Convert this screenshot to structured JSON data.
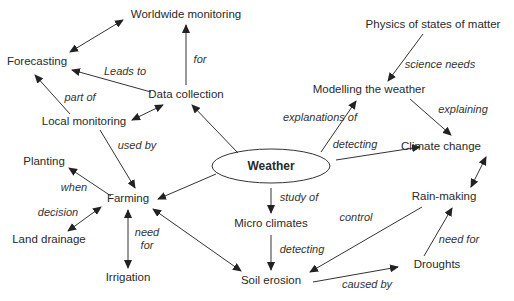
{
  "diagram": {
    "center": {
      "id": "weather",
      "label": "Weather",
      "x": 271,
      "y": 166,
      "rx": 59,
      "ry": 17
    },
    "nodes": [
      {
        "id": "worldwide",
        "label": "Worldwide monitoring",
        "x": 186,
        "y": 15
      },
      {
        "id": "forecasting",
        "label": "Forecasting",
        "x": 37,
        "y": 62
      },
      {
        "id": "data",
        "label": "Data collection",
        "x": 186,
        "y": 95
      },
      {
        "id": "local",
        "label": "Local monitoring",
        "x": 84,
        "y": 122
      },
      {
        "id": "physics",
        "label": "Physics of states of matter",
        "x": 433,
        "y": 25
      },
      {
        "id": "modelling",
        "label": "Modelling the weather",
        "x": 369,
        "y": 90
      },
      {
        "id": "climate",
        "label": "Climate change",
        "x": 441,
        "y": 147
      },
      {
        "id": "planting",
        "label": "Planting",
        "x": 44,
        "y": 162
      },
      {
        "id": "farming",
        "label": "Farming",
        "x": 128,
        "y": 199
      },
      {
        "id": "land",
        "label": "Land drainage",
        "x": 49,
        "y": 240
      },
      {
        "id": "irrigation",
        "label": "Irrigation",
        "x": 128,
        "y": 278
      },
      {
        "id": "micro",
        "label": "Micro climates",
        "x": 271,
        "y": 224
      },
      {
        "id": "soil",
        "label": "Soil erosion",
        "x": 271,
        "y": 281
      },
      {
        "id": "rain",
        "label": "Rain-making",
        "x": 444,
        "y": 197
      },
      {
        "id": "droughts",
        "label": "Droughts",
        "x": 437,
        "y": 265
      }
    ],
    "edges": [
      {
        "x1": 70,
        "y1": 52,
        "x2": 123,
        "y2": 20,
        "start_arrow": true,
        "end_arrow": true
      },
      {
        "x1": 186,
        "y1": 85,
        "x2": 186,
        "y2": 25,
        "start_arrow": false,
        "end_arrow": true
      },
      {
        "x1": 151,
        "y1": 92,
        "x2": 72,
        "y2": 70,
        "start_arrow": false,
        "end_arrow": true
      },
      {
        "x1": 70,
        "y1": 114,
        "x2": 35,
        "y2": 75,
        "start_arrow": false,
        "end_arrow": true
      },
      {
        "x1": 132,
        "y1": 120,
        "x2": 163,
        "y2": 105,
        "start_arrow": true,
        "end_arrow": true
      },
      {
        "x1": 238,
        "y1": 153,
        "x2": 192,
        "y2": 105,
        "start_arrow": false,
        "end_arrow": true
      },
      {
        "x1": 100,
        "y1": 130,
        "x2": 135,
        "y2": 188,
        "start_arrow": false,
        "end_arrow": true
      },
      {
        "x1": 216,
        "y1": 174,
        "x2": 158,
        "y2": 199,
        "start_arrow": false,
        "end_arrow": true
      },
      {
        "x1": 111,
        "y1": 196,
        "x2": 69,
        "y2": 168,
        "start_arrow": false,
        "end_arrow": true
      },
      {
        "x1": 101,
        "y1": 207,
        "x2": 68,
        "y2": 231,
        "start_arrow": true,
        "end_arrow": true
      },
      {
        "x1": 128,
        "y1": 210,
        "x2": 128,
        "y2": 268,
        "start_arrow": true,
        "end_arrow": true
      },
      {
        "x1": 153,
        "y1": 209,
        "x2": 241,
        "y2": 271,
        "start_arrow": true,
        "end_arrow": true
      },
      {
        "x1": 271,
        "y1": 188,
        "x2": 271,
        "y2": 213,
        "start_arrow": false,
        "end_arrow": true
      },
      {
        "x1": 271,
        "y1": 235,
        "x2": 271,
        "y2": 270,
        "start_arrow": false,
        "end_arrow": true
      },
      {
        "x1": 321,
        "y1": 152,
        "x2": 356,
        "y2": 101,
        "start_arrow": false,
        "end_arrow": true
      },
      {
        "x1": 423,
        "y1": 34,
        "x2": 388,
        "y2": 81,
        "start_arrow": false,
        "end_arrow": true
      },
      {
        "x1": 410,
        "y1": 99,
        "x2": 451,
        "y2": 135,
        "start_arrow": false,
        "end_arrow": true
      },
      {
        "x1": 336,
        "y1": 160,
        "x2": 420,
        "y2": 147,
        "start_arrow": false,
        "end_arrow": true
      },
      {
        "x1": 486,
        "y1": 157,
        "x2": 471,
        "y2": 187,
        "start_arrow": true,
        "end_arrow": true
      },
      {
        "x1": 422,
        "y1": 207,
        "x2": 310,
        "y2": 272,
        "start_arrow": false,
        "end_arrow": true
      },
      {
        "x1": 313,
        "y1": 282,
        "x2": 398,
        "y2": 267,
        "start_arrow": false,
        "end_arrow": true
      },
      {
        "x1": 424,
        "y1": 256,
        "x2": 452,
        "y2": 208,
        "start_arrow": false,
        "end_arrow": true
      }
    ],
    "labels": [
      {
        "text": "for",
        "x": 200,
        "y": 59
      },
      {
        "text": "Leads to",
        "x": 125,
        "y": 71
      },
      {
        "text": "part of",
        "x": 80,
        "y": 97
      },
      {
        "text": "used by",
        "x": 137,
        "y": 145
      },
      {
        "text": "explanations of",
        "x": 320,
        "y": 117
      },
      {
        "text": "science needs",
        "x": 440,
        "y": 64
      },
      {
        "text": "explaining",
        "x": 463,
        "y": 109
      },
      {
        "text": "detecting",
        "x": 355,
        "y": 144
      },
      {
        "text": "when",
        "x": 74,
        "y": 187
      },
      {
        "text": "decision",
        "x": 58,
        "y": 212
      },
      {
        "text": "need\nfor",
        "x": 147,
        "y": 239
      },
      {
        "text": "study of",
        "x": 299,
        "y": 197
      },
      {
        "text": "control",
        "x": 356,
        "y": 217
      },
      {
        "text": "detecting",
        "x": 302,
        "y": 249
      },
      {
        "text": "need for",
        "x": 459,
        "y": 239
      },
      {
        "text": "caused by",
        "x": 367,
        "y": 284
      }
    ]
  }
}
